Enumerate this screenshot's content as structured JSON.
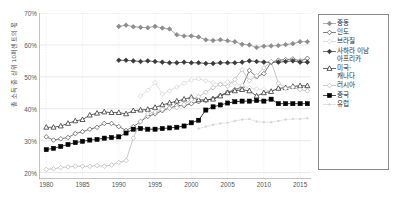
{
  "axes": {
    "ylabel": "총 소득 중 상위 10퍼센트의 몫",
    "xlabel": "",
    "yticks": [
      "20%",
      "30%",
      "40%",
      "50%",
      "60%",
      "70%"
    ],
    "xticks": [
      "1980",
      "1985",
      "1990",
      "1995",
      "2000",
      "2005",
      "2010",
      "2015"
    ]
  },
  "legend": {
    "items": [
      {
        "label": "중동",
        "label2": "",
        "marker": "diamond-filled-gray",
        "color": "#8c8c8c"
      },
      {
        "label": "인도",
        "label2": "",
        "marker": "diamond-open",
        "color": "#4d4d4d"
      },
      {
        "label": "브라질",
        "label2": "",
        "marker": "diamond-open-faint",
        "color": "#cfcfcf"
      },
      {
        "label": "사하라 이남",
        "label2": "아프리카",
        "marker": "diamond-filled-dark",
        "color": "#3a3a3a"
      },
      {
        "label": "미국·",
        "label2": "캐나다",
        "marker": "triangle-open",
        "color": "#2b2b2b"
      },
      {
        "label": "러시아",
        "label2": "",
        "marker": "diamond-open-light",
        "color": "#b5b5b5"
      },
      {
        "label": "중국",
        "label2": "",
        "marker": "square-filled-black",
        "color": "#000000"
      },
      {
        "label": "유럽",
        "label2": "",
        "marker": "dot-faint",
        "color": "#d5d5d5"
      }
    ]
  },
  "chart_data": {
    "type": "line",
    "title": "",
    "xlabel": "",
    "ylabel": "총 소득 중 상위 10퍼센트의 몫",
    "xlim": [
      1979,
      2016.5
    ],
    "ylim": [
      18,
      70
    ],
    "yticks": [
      20,
      30,
      40,
      50,
      60,
      70
    ],
    "xticks": [
      1980,
      1985,
      1990,
      1995,
      2000,
      2005,
      2010,
      2015
    ],
    "ytick_format": "percent",
    "grid": true,
    "legend_position": "right",
    "x": [
      1980,
      1981,
      1982,
      1983,
      1984,
      1985,
      1986,
      1987,
      1988,
      1989,
      1990,
      1991,
      1992,
      1993,
      1994,
      1995,
      1996,
      1997,
      1998,
      1999,
      2000,
      2001,
      2002,
      2003,
      2004,
      2005,
      2006,
      2007,
      2008,
      2009,
      2010,
      2011,
      2012,
      2013,
      2014,
      2015,
      2016
    ],
    "series": [
      {
        "name": "중동",
        "color": "#8c8c8c",
        "marker": "diamond-filled-gray",
        "values": [
          null,
          null,
          null,
          null,
          null,
          null,
          null,
          null,
          null,
          null,
          65.8,
          66.2,
          65.7,
          65.5,
          65.4,
          65.8,
          65.3,
          65.0,
          63.2,
          62.8,
          62.8,
          62.5,
          61.6,
          61.4,
          61.6,
          61.3,
          61.0,
          60.2,
          60.0,
          59.2,
          59.6,
          59.7,
          59.8,
          60.1,
          60.4,
          61.0,
          61.0
        ]
      },
      {
        "name": "인도",
        "color": "#4d4d4d",
        "marker": "diamond-open",
        "values": [
          31.2,
          30.2,
          30.6,
          31.0,
          32.2,
          32.8,
          33.6,
          34.2,
          35.4,
          35.4,
          34.4,
          33.2,
          34.4,
          36.0,
          37.6,
          38.4,
          39.4,
          40.2,
          41.0,
          41.0,
          41.6,
          42.2,
          42.6,
          43.2,
          44.2,
          45.2,
          46.0,
          46.8,
          52.0,
          50.0,
          51.0,
          54.6,
          55.2,
          55.4,
          55.6,
          55.0,
          55.8
        ]
      },
      {
        "name": "브라질",
        "color": "#cfcfcf",
        "marker": "diamond-open-faint",
        "values": [
          null,
          null,
          null,
          null,
          null,
          null,
          null,
          null,
          null,
          null,
          null,
          null,
          null,
          44.0,
          45.8,
          48.2,
          44.6,
          45.6,
          46.8,
          48.0,
          49.0,
          49.4,
          48.8,
          48.2,
          47.8,
          48.4,
          48.0,
          47.4,
          46.6,
          46.2,
          46.0,
          45.6,
          46.2,
          46.6,
          47.0,
          46.8,
          46.8
        ]
      },
      {
        "name": "사하라 이남 아프리카",
        "color": "#3a3a3a",
        "marker": "diamond-filled-dark",
        "values": [
          null,
          null,
          null,
          null,
          null,
          null,
          null,
          null,
          null,
          null,
          55.2,
          55.2,
          55.0,
          54.8,
          55.0,
          54.8,
          54.6,
          54.4,
          54.4,
          54.6,
          54.4,
          54.4,
          54.2,
          54.2,
          54.4,
          54.4,
          54.4,
          54.6,
          55.0,
          54.8,
          54.6,
          54.6,
          54.6,
          54.8,
          55.0,
          54.6,
          54.6
        ]
      },
      {
        "name": "미국·캐나다",
        "color": "#2b2b2b",
        "marker": "triangle-open",
        "values": [
          34.2,
          34.2,
          34.6,
          35.4,
          36.2,
          36.6,
          38.0,
          38.6,
          39.0,
          38.8,
          38.8,
          38.4,
          39.4,
          39.6,
          39.8,
          40.4,
          41.2,
          41.8,
          42.4,
          43.0,
          43.6,
          42.8,
          42.8,
          43.0,
          44.0,
          45.0,
          45.6,
          46.0,
          45.6,
          44.0,
          45.0,
          45.4,
          46.4,
          46.6,
          47.0,
          47.2,
          47.2
        ]
      },
      {
        "name": "러시아",
        "color": "#b5b5b5",
        "marker": "diamond-open-light",
        "values": [
          21.0,
          21.2,
          21.6,
          21.8,
          22.0,
          22.0,
          22.0,
          22.2,
          22.0,
          22.4,
          23.2,
          23.8,
          30.8,
          36.0,
          38.4,
          39.0,
          39.8,
          40.2,
          40.4,
          41.4,
          42.8,
          43.8,
          45.2,
          46.6,
          47.6,
          47.0,
          49.2,
          52.2,
          48.8,
          50.4,
          52.8,
          54.8,
          48.0,
          46.4,
          46.8,
          46.0,
          45.6
        ]
      },
      {
        "name": "중국",
        "color": "#000000",
        "marker": "square-filled-black",
        "values": [
          27.2,
          27.6,
          28.2,
          28.8,
          29.4,
          29.8,
          30.2,
          30.4,
          30.8,
          31.0,
          31.2,
          32.4,
          33.6,
          33.8,
          33.6,
          33.6,
          33.8,
          34.0,
          34.2,
          34.6,
          35.6,
          36.4,
          39.6,
          40.6,
          41.2,
          41.8,
          42.2,
          42.4,
          42.4,
          42.6,
          42.4,
          43.0,
          41.6,
          41.6,
          41.6,
          41.6,
          41.6
        ]
      },
      {
        "name": "유럽",
        "color": "#d5d5d5",
        "marker": "dot-faint",
        "values": [
          null,
          null,
          null,
          null,
          null,
          null,
          null,
          null,
          null,
          null,
          null,
          null,
          null,
          null,
          null,
          null,
          null,
          null,
          null,
          null,
          null,
          33.8,
          34.4,
          35.0,
          35.4,
          35.6,
          36.2,
          36.6,
          36.8,
          36.0,
          35.8,
          35.8,
          36.2,
          36.6,
          36.8,
          36.8,
          37.0
        ]
      }
    ]
  }
}
